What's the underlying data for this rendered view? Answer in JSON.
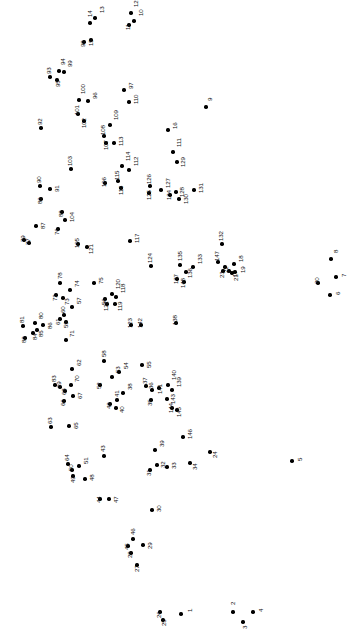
{
  "puzzle": {
    "type": "connect-the-dots",
    "width": 349,
    "height": 630,
    "background_color": "#ffffff",
    "dot_color": "#000000",
    "label_color": "#111111",
    "label_rotation_deg": -90,
    "dot_count": 148,
    "dots": [
      {
        "n": "1",
        "x": 181,
        "y": 614,
        "lx": 6,
        "ly": -2
      },
      {
        "n": "2",
        "x": 233,
        "y": 612,
        "lx": -3,
        "ly": -7
      },
      {
        "n": "3",
        "x": 243,
        "y": 622,
        "lx": -1,
        "ly": 7
      },
      {
        "n": "4",
        "x": 253,
        "y": 612,
        "lx": 5,
        "ly": 0
      },
      {
        "n": "5",
        "x": 292,
        "y": 461,
        "lx": 5,
        "ly": 0
      },
      {
        "n": "6",
        "x": 330,
        "y": 295,
        "lx": 5,
        "ly": 0
      },
      {
        "n": "7",
        "x": 336,
        "y": 277,
        "lx": 5,
        "ly": 0
      },
      {
        "n": "8",
        "x": 331,
        "y": 259,
        "lx": 2,
        "ly": -6
      },
      {
        "n": "9",
        "x": 206,
        "y": 107,
        "lx": 1,
        "ly": -6
      },
      {
        "n": "10",
        "x": 134,
        "y": 21,
        "lx": 4,
        "ly": -5
      },
      {
        "n": "11",
        "x": 129,
        "y": 25,
        "lx": -4,
        "ly": 5
      },
      {
        "n": "12",
        "x": 131,
        "y": 13,
        "lx": 2,
        "ly": -6
      },
      {
        "n": "13",
        "x": 95,
        "y": 18,
        "lx": 4,
        "ly": -5
      },
      {
        "n": "14",
        "x": 90,
        "y": 23,
        "lx": -3,
        "ly": -6
      },
      {
        "n": "15",
        "x": 91,
        "y": 40,
        "lx": -3,
        "ly": 6
      },
      {
        "n": "16",
        "x": 168,
        "y": 130,
        "lx": 4,
        "ly": -1
      },
      {
        "n": "17",
        "x": 229,
        "y": 271,
        "lx": 3,
        "ly": 6
      },
      {
        "n": "18",
        "x": 234,
        "y": 264,
        "lx": 4,
        "ly": -2
      },
      {
        "n": "19",
        "x": 235,
        "y": 272,
        "lx": 5,
        "ly": 1
      },
      {
        "n": "20",
        "x": 318,
        "y": 283,
        "lx": -4,
        "ly": 1
      },
      {
        "n": "21",
        "x": 232,
        "y": 273,
        "lx": 1,
        "ly": 8
      },
      {
        "n": "22",
        "x": 225,
        "y": 267,
        "lx": -2,
        "ly": 6
      },
      {
        "n": "23",
        "x": 223,
        "y": 271,
        "lx": -4,
        "ly": 7
      },
      {
        "n": "24",
        "x": 210,
        "y": 452,
        "lx": 2,
        "ly": 6
      },
      {
        "n": "25",
        "x": 163,
        "y": 620,
        "lx": -2,
        "ly": 6
      },
      {
        "n": "26",
        "x": 160,
        "y": 612,
        "lx": -4,
        "ly": 6
      },
      {
        "n": "27",
        "x": 137,
        "y": 565,
        "lx": -3,
        "ly": 7
      },
      {
        "n": "28",
        "x": 131,
        "y": 553,
        "lx": -4,
        "ly": 5
      },
      {
        "n": "29",
        "x": 143,
        "y": 545,
        "lx": 4,
        "ly": 4
      },
      {
        "n": "30",
        "x": 152,
        "y": 510,
        "lx": 4,
        "ly": 2
      },
      {
        "n": "31",
        "x": 150,
        "y": 470,
        "lx": -4,
        "ly": 6
      },
      {
        "n": "32",
        "x": 157,
        "y": 465,
        "lx": 3,
        "ly": 3
      },
      {
        "n": "33",
        "x": 167,
        "y": 467,
        "lx": 4,
        "ly": 2
      },
      {
        "n": "34",
        "x": 190,
        "y": 463,
        "lx": 2,
        "ly": 7
      },
      {
        "n": "35",
        "x": 151,
        "y": 400,
        "lx": -4,
        "ly": 6
      },
      {
        "n": "36",
        "x": 152,
        "y": 390,
        "lx": -4,
        "ly": -1
      },
      {
        "n": "37",
        "x": 146,
        "y": 386,
        "lx": -4,
        "ly": -2
      },
      {
        "n": "38",
        "x": 123,
        "y": 393,
        "lx": 4,
        "ly": -3
      },
      {
        "n": "39",
        "x": 155,
        "y": 450,
        "lx": 4,
        "ly": -3
      },
      {
        "n": "40",
        "x": 116,
        "y": 408,
        "lx": 3,
        "ly": 5
      },
      {
        "n": "41",
        "x": 117,
        "y": 400,
        "lx": -3,
        "ly": -3
      },
      {
        "n": "42",
        "x": 110,
        "y": 404,
        "lx": -4,
        "ly": 5
      },
      {
        "n": "43",
        "x": 104,
        "y": 456,
        "lx": -4,
        "ly": -4
      },
      {
        "n": "44",
        "x": 100,
        "y": 499,
        "lx": -4,
        "ly": 4
      },
      {
        "n": "45",
        "x": 128,
        "y": 546,
        "lx": -4,
        "ly": 4
      },
      {
        "n": "46",
        "x": 133,
        "y": 539,
        "lx": -3,
        "ly": -4
      },
      {
        "n": "47",
        "x": 109,
        "y": 499,
        "lx": 4,
        "ly": 4
      },
      {
        "n": "48",
        "x": 85,
        "y": 479,
        "lx": 4,
        "ly": 2
      },
      {
        "n": "49",
        "x": 73,
        "y": 476,
        "lx": -3,
        "ly": 7
      },
      {
        "n": "50",
        "x": 72,
        "y": 470,
        "lx": -4,
        "ly": 1
      },
      {
        "n": "51",
        "x": 79,
        "y": 466,
        "lx": 4,
        "ly": -2
      },
      {
        "n": "52",
        "x": 100,
        "y": 385,
        "lx": -4,
        "ly": 4
      },
      {
        "n": "53",
        "x": 112,
        "y": 377,
        "lx": 3,
        "ly": -4
      },
      {
        "n": "54",
        "x": 119,
        "y": 372,
        "lx": 4,
        "ly": -3
      },
      {
        "n": "55",
        "x": 142,
        "y": 365,
        "lx": 4,
        "ly": 3
      },
      {
        "n": "56",
        "x": 105,
        "y": 299,
        "lx": -4,
        "ly": 6
      },
      {
        "n": "57",
        "x": 72,
        "y": 307,
        "lx": 4,
        "ly": -3
      },
      {
        "n": "58",
        "x": 104,
        "y": 361,
        "lx": -3,
        "ly": -4
      },
      {
        "n": "59",
        "x": 66,
        "y": 322,
        "lx": -3,
        "ly": 6
      },
      {
        "n": "60",
        "x": 64,
        "y": 315,
        "lx": -4,
        "ly": -2
      },
      {
        "n": "61",
        "x": 60,
        "y": 319,
        "lx": -5,
        "ly": 6
      },
      {
        "n": "62",
        "x": 72,
        "y": 369,
        "lx": 4,
        "ly": -3
      },
      {
        "n": "63",
        "x": 51,
        "y": 427,
        "lx": -4,
        "ly": -3
      },
      {
        "n": "64",
        "x": 68,
        "y": 464,
        "lx": -4,
        "ly": -3
      },
      {
        "n": "65",
        "x": 69,
        "y": 426,
        "lx": 4,
        "ly": 3
      },
      {
        "n": "66",
        "x": 64,
        "y": 401,
        "lx": -4,
        "ly": 5
      },
      {
        "n": "67",
        "x": 73,
        "y": 396,
        "lx": 4,
        "ly": 3
      },
      {
        "n": "68",
        "x": 65,
        "y": 391,
        "lx": -4,
        "ly": 4
      },
      {
        "n": "69",
        "x": 60,
        "y": 387,
        "lx": -4,
        "ly": 1
      },
      {
        "n": "70",
        "x": 71,
        "y": 385,
        "lx": 3,
        "ly": -3
      },
      {
        "n": "71",
        "x": 66,
        "y": 340,
        "lx": 3,
        "ly": -3
      },
      {
        "n": "72",
        "x": 56,
        "y": 295,
        "lx": -4,
        "ly": 6
      },
      {
        "n": "73",
        "x": 63,
        "y": 298,
        "lx": 1,
        "ly": 7
      },
      {
        "n": "74",
        "x": 70,
        "y": 290,
        "lx": 4,
        "ly": -3
      },
      {
        "n": "75",
        "x": 94,
        "y": 283,
        "lx": 4,
        "ly": 1
      },
      {
        "n": "76",
        "x": 58,
        "y": 229,
        "lx": -4,
        "ly": 6
      },
      {
        "n": "77",
        "x": 29,
        "y": 243,
        "lx": -4,
        "ly": 2
      },
      {
        "n": "78",
        "x": 60,
        "y": 283,
        "lx": -3,
        "ly": -4
      },
      {
        "n": "79",
        "x": 24,
        "y": 240,
        "lx": -4,
        "ly": 2
      },
      {
        "n": "80",
        "x": 35,
        "y": 323,
        "lx": 3,
        "ly": -4
      },
      {
        "n": "81",
        "x": 23,
        "y": 326,
        "lx": -4,
        "ly": -3
      },
      {
        "n": "82",
        "x": 25,
        "y": 338,
        "lx": -4,
        "ly": 5
      },
      {
        "n": "83",
        "x": 55,
        "y": 385,
        "lx": -4,
        "ly": -3
      },
      {
        "n": "84",
        "x": 33,
        "y": 333,
        "lx": -1,
        "ly": 7
      },
      {
        "n": "85",
        "x": 37,
        "y": 330,
        "lx": 1,
        "ly": 7
      },
      {
        "n": "86",
        "x": 43,
        "y": 325,
        "lx": 4,
        "ly": 4
      },
      {
        "n": "87",
        "x": 36,
        "y": 226,
        "lx": 4,
        "ly": 3
      },
      {
        "n": "88",
        "x": 62,
        "y": 212,
        "lx": -4,
        "ly": 5
      },
      {
        "n": "89",
        "x": 41,
        "y": 199,
        "lx": -4,
        "ly": 5
      },
      {
        "n": "90",
        "x": 40,
        "y": 186,
        "lx": -4,
        "ly": -3
      },
      {
        "n": "91",
        "x": 50,
        "y": 189,
        "lx": 4,
        "ly": 3
      },
      {
        "n": "92",
        "x": 41,
        "y": 128,
        "lx": -4,
        "ly": -3
      },
      {
        "n": "93",
        "x": 50,
        "y": 77,
        "lx": -4,
        "ly": -3
      },
      {
        "n": "94",
        "x": 59,
        "y": 71,
        "lx": 1,
        "ly": -6
      },
      {
        "n": "95",
        "x": 57,
        "y": 80,
        "lx": -2,
        "ly": 7
      },
      {
        "n": "96",
        "x": 88,
        "y": 101,
        "lx": 4,
        "ly": -2
      },
      {
        "n": "97",
        "x": 124,
        "y": 90,
        "lx": 4,
        "ly": -1
      },
      {
        "n": "98",
        "x": 84,
        "y": 42,
        "lx": -4,
        "ly": 5
      },
      {
        "n": "99",
        "x": 64,
        "y": 72,
        "lx": 3,
        "ly": -5
      },
      {
        "n": "100",
        "x": 79,
        "y": 100,
        "lx": 1,
        "ly": -6
      },
      {
        "n": "101",
        "x": 78,
        "y": 114,
        "lx": -4,
        "ly": 1
      },
      {
        "n": "102",
        "x": 84,
        "y": 121,
        "lx": -3,
        "ly": 7
      },
      {
        "n": "103",
        "x": 71,
        "y": 169,
        "lx": -4,
        "ly": -3
      },
      {
        "n": "104",
        "x": 65,
        "y": 220,
        "lx": 4,
        "ly": 2
      },
      {
        "n": "105",
        "x": 78,
        "y": 244,
        "lx": -4,
        "ly": 4
      },
      {
        "n": "106",
        "x": 105,
        "y": 183,
        "lx": -4,
        "ly": 4
      },
      {
        "n": "107",
        "x": 106,
        "y": 143,
        "lx": -3,
        "ly": 7
      },
      {
        "n": "108",
        "x": 104,
        "y": 136,
        "lx": -4,
        "ly": -1
      },
      {
        "n": "109",
        "x": 110,
        "y": 125,
        "lx": 3,
        "ly": -5
      },
      {
        "n": "110",
        "x": 129,
        "y": 102,
        "lx": 4,
        "ly": 2
      },
      {
        "n": "111",
        "x": 173,
        "y": 152,
        "lx": 3,
        "ly": -5
      },
      {
        "n": "112",
        "x": 129,
        "y": 170,
        "lx": 4,
        "ly": -4
      },
      {
        "n": "113",
        "x": 114,
        "y": 143,
        "lx": 4,
        "ly": 3
      },
      {
        "n": "114",
        "x": 122,
        "y": 166,
        "lx": 3,
        "ly": -5
      },
      {
        "n": "115",
        "x": 118,
        "y": 181,
        "lx": -4,
        "ly": -1
      },
      {
        "n": "116",
        "x": 121,
        "y": 188,
        "lx": -3,
        "ly": 7
      },
      {
        "n": "117",
        "x": 130,
        "y": 241,
        "lx": 4,
        "ly": 2
      },
      {
        "n": "118",
        "x": 116,
        "y": 297,
        "lx": 4,
        "ly": -4
      },
      {
        "n": "119",
        "x": 115,
        "y": 304,
        "lx": 2,
        "ly": 7
      },
      {
        "n": "120",
        "x": 112,
        "y": 294,
        "lx": 3,
        "ly": -5
      },
      {
        "n": "121",
        "x": 87,
        "y": 247,
        "lx": 1,
        "ly": 7
      },
      {
        "n": "122",
        "x": 107,
        "y": 304,
        "lx": -4,
        "ly": 7
      },
      {
        "n": "123",
        "x": 131,
        "y": 325,
        "lx": -4,
        "ly": 3
      },
      {
        "n": "124",
        "x": 151,
        "y": 266,
        "lx": -4,
        "ly": -3
      },
      {
        "n": "125",
        "x": 149,
        "y": 193,
        "lx": -3,
        "ly": 7
      },
      {
        "n": "126",
        "x": 150,
        "y": 186,
        "lx": -4,
        "ly": -2
      },
      {
        "n": "127",
        "x": 161,
        "y": 190,
        "lx": 4,
        "ly": -2
      },
      {
        "n": "128",
        "x": 176,
        "y": 192,
        "lx": 3,
        "ly": 5
      },
      {
        "n": "129",
        "x": 177,
        "y": 162,
        "lx": 3,
        "ly": 5
      },
      {
        "n": "130",
        "x": 179,
        "y": 199,
        "lx": 4,
        "ly": 5
      },
      {
        "n": "131",
        "x": 194,
        "y": 190,
        "lx": 4,
        "ly": 3
      },
      {
        "n": "132",
        "x": 222,
        "y": 244,
        "lx": -4,
        "ly": -3
      },
      {
        "n": "133",
        "x": 193,
        "y": 267,
        "lx": 4,
        "ly": -3
      },
      {
        "n": "134",
        "x": 170,
        "y": 195,
        "lx": -4,
        "ly": 5
      },
      {
        "n": "135",
        "x": 180,
        "y": 265,
        "lx": -3,
        "ly": -4
      },
      {
        "n": "136",
        "x": 186,
        "y": 272,
        "lx": 1,
        "ly": 6
      },
      {
        "n": "137",
        "x": 177,
        "y": 279,
        "lx": -4,
        "ly": 5
      },
      {
        "n": "138",
        "x": 176,
        "y": 323,
        "lx": -4,
        "ly": 2
      },
      {
        "n": "139",
        "x": 172,
        "y": 390,
        "lx": 4,
        "ly": -3
      },
      {
        "n": "140",
        "x": 168,
        "y": 385,
        "lx": 3,
        "ly": -5
      },
      {
        "n": "141",
        "x": 159,
        "y": 388,
        "lx": -2,
        "ly": 6
      },
      {
        "n": "142",
        "x": 141,
        "y": 325,
        "lx": -4,
        "ly": 3
      },
      {
        "n": "143",
        "x": 167,
        "y": 399,
        "lx": 3,
        "ly": 5
      },
      {
        "n": "144",
        "x": 172,
        "y": 408,
        "lx": -4,
        "ly": 5
      },
      {
        "n": "145",
        "x": 177,
        "y": 410,
        "lx": -1,
        "ly": 7
      },
      {
        "n": "146",
        "x": 183,
        "y": 437,
        "lx": 4,
        "ly": 2
      },
      {
        "n": "147",
        "x": 218,
        "y": 262,
        "lx": -4,
        "ly": -1
      },
      {
        "n": "148",
        "x": 184,
        "y": 282,
        "lx": -4,
        "ly": 6
      }
    ]
  }
}
